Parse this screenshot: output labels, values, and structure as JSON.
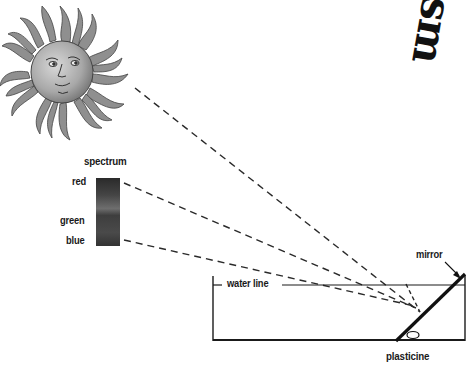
{
  "diagram": {
    "title_fragment": "sm",
    "labels": {
      "spectrum": "spectrum",
      "red": "red",
      "green": "green",
      "blue": "blue",
      "water_line": "water line",
      "mirror": "mirror",
      "plasticine": "plasticine"
    },
    "elements": {
      "sun": "sun-illustration",
      "spectrum_bar": "spectrum-bar",
      "tank": "water-tank",
      "mirror": "angled-mirror",
      "light_rays": [
        "sun-ray",
        "red-ray",
        "blue-ray"
      ]
    },
    "colors": {
      "ink": "#1a1a1a",
      "sun_fill": "#9a9a9a",
      "spectrum_dark": "#2a2a2a",
      "spectrum_mid": "#6a6a6a"
    }
  }
}
